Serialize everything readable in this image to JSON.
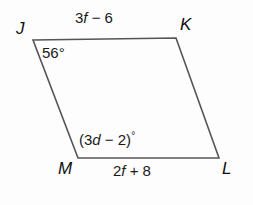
{
  "figure": {
    "shape": "parallelogram",
    "name": "parallelogram-JKLM",
    "stroke_color": "#555555",
    "background_color": "#fdfdfd",
    "text_color": "#1a1a1a",
    "vertices": [
      {
        "name": "J",
        "label": "J",
        "x": 33,
        "y": 40
      },
      {
        "name": "K",
        "label": "K",
        "x": 176,
        "y": 38
      },
      {
        "name": "L",
        "label": "L",
        "x": 219,
        "y": 158
      },
      {
        "name": "M",
        "label": "M",
        "x": 78,
        "y": 158
      }
    ],
    "side_labels": [
      {
        "name": "side-JK",
        "text": "3f − 6",
        "prefix": "3",
        "variable": "f",
        "suffix": " − 6"
      },
      {
        "name": "side-ML",
        "text": "2f + 8",
        "prefix": "2",
        "variable": "f",
        "suffix": " + 8"
      }
    ],
    "angle_labels": [
      {
        "name": "angle-J",
        "text": "56°",
        "value": "56",
        "unit": "°"
      },
      {
        "name": "angle-M",
        "text": "(3d − 2)°",
        "prefix": "(3",
        "variable": "d",
        "suffix": " − 2)",
        "unit": "°"
      }
    ]
  }
}
